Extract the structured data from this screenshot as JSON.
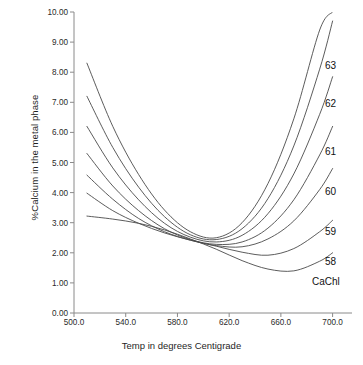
{
  "chart_data": {
    "type": "line",
    "title": "",
    "xlabel": "Temp in degrees Centigrade",
    "ylabel": "%Calcium in the metal phase",
    "xlim": [
      500.0,
      715.0
    ],
    "ylim": [
      0.0,
      10.0
    ],
    "grid": false,
    "legend_position": "right-inline-end-labels",
    "xticks": [
      "500.0",
      "540.0",
      "580.0",
      "620.0",
      "660.0",
      "700.0"
    ],
    "xtick_values": [
      500.0,
      540.0,
      580.0,
      620.0,
      660.0,
      700.0
    ],
    "yticks": [
      "0.00",
      "1.00",
      "2.00",
      "3.00",
      "4.00",
      "5.00",
      "6.00",
      "7.00",
      "8.00",
      "9.00",
      "10.00"
    ],
    "ytick_values": [
      0.0,
      1.0,
      2.0,
      3.0,
      4.0,
      5.0,
      6.0,
      7.0,
      8.0,
      9.0,
      10.0
    ],
    "x": [
      510,
      530,
      550,
      570,
      590,
      610,
      630,
      650,
      670,
      690,
      700
    ],
    "series": [
      {
        "name": "63",
        "label": "63",
        "values": [
          8.3,
          6.2,
          4.6,
          3.42,
          2.7,
          2.5,
          3.0,
          4.3,
          6.45,
          9.4,
          10.0
        ],
        "min_point": {
          "x": 607,
          "y": 2.48
        }
      },
      {
        "name": "62",
        "label": "62",
        "values": [
          7.2,
          5.5,
          4.18,
          3.2,
          2.6,
          2.44,
          2.8,
          3.8,
          5.55,
          8.1,
          9.7
        ],
        "min_point": {
          "x": 612,
          "y": 2.42
        }
      },
      {
        "name": "61",
        "label": "61",
        "values": [
          6.2,
          4.82,
          3.76,
          2.98,
          2.52,
          2.36,
          2.58,
          3.3,
          4.62,
          6.6,
          7.85
        ],
        "min_point": {
          "x": 618,
          "y": 2.34
        }
      },
      {
        "name": "60",
        "label": "60",
        "values": [
          5.3,
          4.22,
          3.4,
          2.8,
          2.44,
          2.28,
          2.36,
          2.82,
          3.76,
          5.25,
          6.2
        ],
        "min_point": {
          "x": 624,
          "y": 2.26
        }
      },
      {
        "name": "59",
        "label": "59",
        "values": [
          4.58,
          3.78,
          3.14,
          2.7,
          2.42,
          2.24,
          2.2,
          2.46,
          3.06,
          4.1,
          4.8
        ],
        "min_point": {
          "x": 632,
          "y": 2.19
        }
      },
      {
        "name": "58",
        "label": "58",
        "values": [
          3.98,
          3.4,
          2.98,
          2.66,
          2.42,
          2.22,
          2.02,
          1.92,
          2.14,
          2.7,
          3.08
        ],
        "min_point": {
          "x": 648,
          "y": 1.9
        }
      },
      {
        "name": "CaChl",
        "label": "CaChl",
        "values": [
          3.22,
          3.12,
          2.98,
          2.76,
          2.46,
          2.12,
          1.74,
          1.46,
          1.4,
          1.72,
          2.0
        ],
        "min_point": {
          "x": 662,
          "y": 1.36
        }
      }
    ],
    "series_label_positions": [
      {
        "label": "63",
        "x_px": 325,
        "y_px": 60
      },
      {
        "label": "62",
        "x_px": 325,
        "y_px": 98
      },
      {
        "label": "61",
        "x_px": 325,
        "y_px": 146
      },
      {
        "label": "60",
        "x_px": 325,
        "y_px": 186
      },
      {
        "label": "59",
        "x_px": 325,
        "y_px": 226
      },
      {
        "label": "58",
        "x_px": 325,
        "y_px": 256
      },
      {
        "label": "CaChl",
        "x_px": 312,
        "y_px": 276
      }
    ],
    "colors": {
      "line": "#4a4a4a",
      "axis": "#808080",
      "text": "#1a1a1a",
      "background": "#ffffff"
    }
  }
}
